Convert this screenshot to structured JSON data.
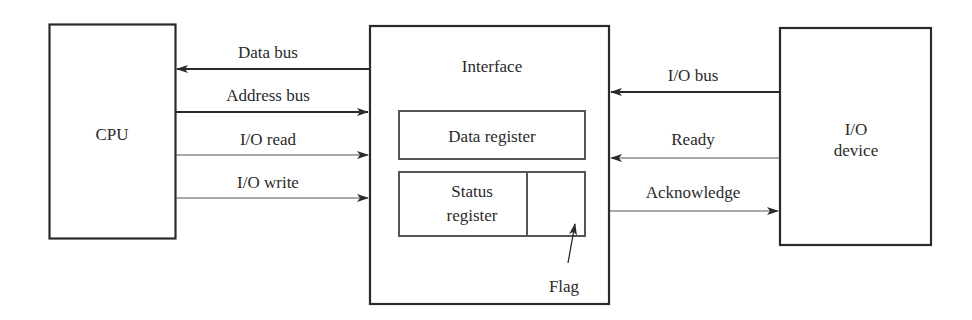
{
  "diagram": {
    "blocks": {
      "cpu": {
        "label": "CPU"
      },
      "interface": {
        "label": "Interface",
        "data_register": {
          "label": "Data register"
        },
        "status_register": {
          "line1": "Status",
          "line2": "register"
        },
        "flag": {
          "label": "Flag"
        }
      },
      "io_device": {
        "line1": "I/O",
        "line2": "device"
      }
    },
    "cpu_interface_signals": [
      {
        "label": "Data bus",
        "direction": "interface-to-cpu",
        "weight": "bus"
      },
      {
        "label": "Address bus",
        "direction": "cpu-to-interface",
        "weight": "bus"
      },
      {
        "label": "I/O read",
        "direction": "cpu-to-interface",
        "weight": "control"
      },
      {
        "label": "I/O write",
        "direction": "cpu-to-interface",
        "weight": "control"
      }
    ],
    "interface_device_signals": [
      {
        "label": "I/O bus",
        "direction": "device-to-interface",
        "weight": "bus"
      },
      {
        "label": "Ready",
        "direction": "device-to-interface",
        "weight": "control"
      },
      {
        "label": "Acknowledge",
        "direction": "interface-to-device",
        "weight": "control"
      }
    ],
    "colors": {
      "line": "#2a2a2a",
      "inner_line": "#555555",
      "background": "#ffffff"
    }
  }
}
